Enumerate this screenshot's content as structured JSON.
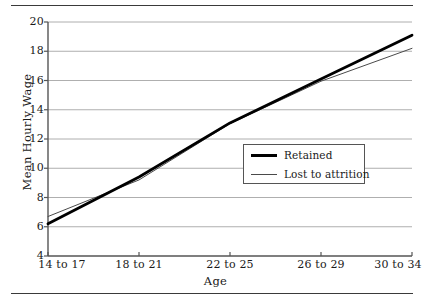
{
  "chart_data": {
    "type": "line",
    "title": "",
    "xlabel": "Age",
    "ylabel": "Mean Hourly Wage",
    "categories": [
      "14 to 17",
      "18 to 21",
      "22 to 25",
      "26 to 29",
      "30 to 34"
    ],
    "series": [
      {
        "name": "Retained",
        "values": [
          6.2,
          9.4,
          13.1,
          16.1,
          19.1
        ],
        "style": "thick",
        "color": "#000000"
      },
      {
        "name": "Lost to attrition",
        "values": [
          6.7,
          9.2,
          13.05,
          15.95,
          18.2
        ],
        "style": "thin",
        "color": "#4a4a4a"
      }
    ],
    "ylim": [
      4,
      20
    ],
    "yticks": [
      4,
      6,
      8,
      10,
      12,
      14,
      16,
      18,
      20
    ],
    "ytick_labels": [
      "4",
      "6",
      "8",
      "10",
      "12",
      "14",
      "16",
      "18",
      "20"
    ],
    "grid": "horizontal",
    "grid_color": "#9a9a9a",
    "legend_position": "center-right",
    "axis_color": "#555555"
  },
  "legend": {
    "entries": [
      {
        "label": "Retained"
      },
      {
        "label": "Lost to attrition"
      }
    ]
  }
}
